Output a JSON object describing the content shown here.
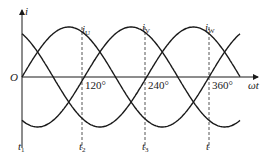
{
  "diagram": {
    "type": "three-phase-current-waveform",
    "axes": {
      "y_label": "i",
      "x_label": "ωt",
      "origin_label": "O"
    },
    "angle_ticks": [
      {
        "label": "120°",
        "deg": 120
      },
      {
        "label": "240°",
        "deg": 240
      },
      {
        "label": "360°",
        "deg": 360
      }
    ],
    "curve_labels": [
      {
        "main": "i",
        "sub": "U"
      },
      {
        "main": "i",
        "sub": "V"
      },
      {
        "main": "i",
        "sub": "W"
      }
    ],
    "time_labels": [
      {
        "main": "t",
        "sub": "1"
      },
      {
        "main": "t",
        "sub": "2"
      },
      {
        "main": "t",
        "sub": "3"
      },
      {
        "main": "t",
        "sub": ""
      }
    ],
    "colors": {
      "line": "#1a1a1a",
      "dashed": "#555555",
      "background": "#ffffff"
    }
  }
}
